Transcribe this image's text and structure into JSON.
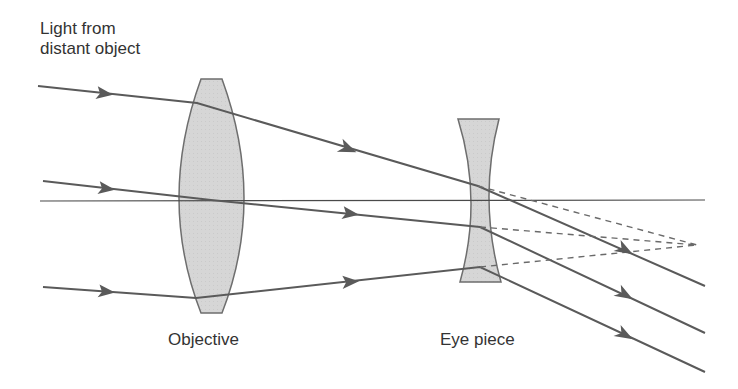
{
  "diagram": {
    "source_label": {
      "line1": "Light from",
      "line2": "distant object"
    },
    "lenses": [
      {
        "id": "objective",
        "label": "Objective",
        "type": "convex"
      },
      {
        "id": "eyepiece",
        "label": "Eye piece",
        "type": "concave"
      }
    ],
    "rays_count": 3,
    "colors": {
      "ray": "#5a5a5a",
      "lens_fill": "#d4d4d4",
      "lens_stroke": "#6e6e6e",
      "axis": "#4a4a4a",
      "text": "#333333"
    }
  }
}
